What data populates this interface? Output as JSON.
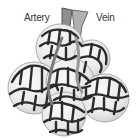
{
  "diagram": {
    "labels": {
      "artery": "Artery",
      "vein": "Vein"
    },
    "colors": {
      "background": "#ffffff",
      "alveolus_fill": "#ececec",
      "alveolus_highlight": "#f8f8f8",
      "capillary": "#2b2b2b",
      "artery_vessel": "#8a8a8a",
      "vein_vessel": "#a8a8a8",
      "label_text": "#333333"
    }
  }
}
